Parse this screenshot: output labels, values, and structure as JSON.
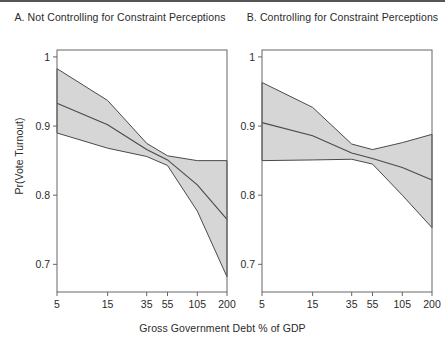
{
  "figure": {
    "x_axis_title": "Gross Government Debt % of GDP",
    "y_axis_title": "Pr(Vote Turnout)",
    "band_color": "#d6d6d6",
    "line_color": "#4a4a4a",
    "axis_color": "#666666"
  },
  "chart_data": [
    {
      "type": "line",
      "title": "A. Not Controlling for Constraint Perceptions",
      "xlabel": "Gross Government Debt % of GDP",
      "ylabel": "Pr(Vote Turnout)",
      "xscale": "log",
      "xticks": [
        5,
        15,
        35,
        55,
        105,
        200
      ],
      "xticklabels": [
        "5",
        "15",
        "35",
        "55",
        "105",
        "200"
      ],
      "yticks": [
        0.7,
        0.8,
        0.9,
        1
      ],
      "yticklabels": [
        "0.7",
        "0.8",
        "0.9",
        "1"
      ],
      "ylim": [
        0.66,
        1.01
      ],
      "xlim": [
        5,
        200
      ],
      "grid": false,
      "legend": "none",
      "x": [
        5,
        15,
        35,
        55,
        105,
        200
      ],
      "series": [
        {
          "name": "Predicted probability",
          "values": [
            0.933,
            0.902,
            0.866,
            0.851,
            0.815,
            0.765
          ]
        },
        {
          "name": "Upper 95% CI",
          "values": [
            0.983,
            0.937,
            0.875,
            0.857,
            0.85,
            0.85
          ]
        },
        {
          "name": "Lower 95% CI",
          "values": [
            0.89,
            0.868,
            0.856,
            0.843,
            0.777,
            0.682
          ]
        }
      ]
    },
    {
      "type": "line",
      "title": "B. Controlling for Constraint Perceptions",
      "xlabel": "Gross Government Debt % of GDP",
      "ylabel": "Pr(Vote Turnout)",
      "xscale": "log",
      "xticks": [
        5,
        15,
        35,
        55,
        105,
        200
      ],
      "xticklabels": [
        "5",
        "15",
        "35",
        "55",
        "105",
        "200"
      ],
      "yticks": [
        0.7,
        0.8,
        0.9,
        1
      ],
      "yticklabels": [
        "0.7",
        "0.8",
        "0.9",
        "1"
      ],
      "ylim": [
        0.66,
        1.01
      ],
      "xlim": [
        5,
        200
      ],
      "grid": false,
      "legend": "none",
      "x": [
        5,
        15,
        35,
        55,
        105,
        200
      ],
      "series": [
        {
          "name": "Predicted probability",
          "values": [
            0.905,
            0.886,
            0.861,
            0.853,
            0.84,
            0.822
          ]
        },
        {
          "name": "Upper 95% CI",
          "values": [
            0.963,
            0.927,
            0.874,
            0.866,
            0.876,
            0.888
          ]
        },
        {
          "name": "Lower 95% CI",
          "values": [
            0.85,
            0.851,
            0.852,
            0.845,
            0.8,
            0.753
          ]
        }
      ]
    }
  ]
}
